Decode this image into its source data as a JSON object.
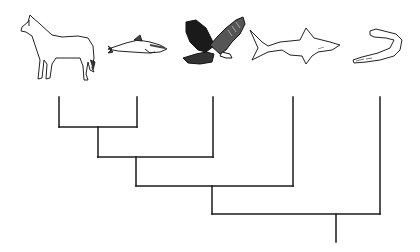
{
  "diagram": {
    "type": "cladogram",
    "taxa": [
      {
        "id": "horse",
        "name": "Horse"
      },
      {
        "id": "dolphin",
        "name": "Dolphin"
      },
      {
        "id": "eagle",
        "name": "Eagle"
      },
      {
        "id": "shark",
        "name": "Shark"
      },
      {
        "id": "lamprey",
        "name": "Lamprey"
      }
    ],
    "tree": "((((horse,dolphin),eagle),shark),lamprey)",
    "dashed_branches": [
      "eagle"
    ],
    "colors": {
      "line": "#1a1a1a",
      "background": "#ffffff"
    }
  }
}
